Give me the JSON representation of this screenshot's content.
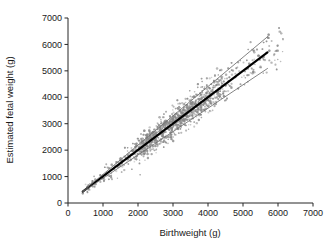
{
  "chart_data": {
    "type": "scatter",
    "title": "",
    "xlabel": "Birthweight (g)",
    "ylabel": "Estimated fetal weight (g)",
    "xlim": [
      0,
      7000
    ],
    "ylim": [
      0,
      7000
    ],
    "xticks": [
      0,
      1000,
      2000,
      3000,
      4000,
      5000,
      6000,
      7000
    ],
    "yticks": [
      0,
      1000,
      2000,
      3000,
      4000,
      5000,
      6000,
      7000
    ],
    "xticklabels": [
      "0",
      "1000",
      "2000",
      "3000",
      "4000",
      "5000",
      "6000",
      "7000"
    ],
    "yticklabels": [
      "0",
      "1000",
      "2000",
      "3000",
      "4000",
      "5000",
      "6000",
      "7000"
    ],
    "grid": false,
    "legend": "none",
    "point_color": "#8a8a8a",
    "point_size": 1.1,
    "n_points": 2100,
    "scatter_description": "Dense elongated cloud of small grey dots running diagonally from about (450,400) to (6100,5500), most densely packed between 2000 and 4000 g on both axes.",
    "scatter_domain": [
      420,
      6150
    ],
    "scatter_core_domain": [
      2000,
      4200
    ],
    "residual_sd_low": 120,
    "residual_sd_high": 430,
    "series": [
      {
        "name": "regression-line",
        "type": "line",
        "style": "thick-solid-black",
        "color": "#000000",
        "width": 2.1,
        "x": [
          420,
          5700
        ],
        "y": [
          430,
          5700
        ]
      },
      {
        "name": "upper-prediction-limit",
        "type": "line",
        "style": "thin-solid-grey",
        "color": "#6e6e6e",
        "width": 0.85,
        "x": [
          420,
          5700
        ],
        "y": [
          440,
          6290
        ]
      },
      {
        "name": "lower-prediction-limit",
        "type": "line",
        "style": "thin-solid-grey",
        "color": "#6e6e6e",
        "width": 0.85,
        "x": [
          420,
          5700
        ],
        "y": [
          420,
          5090
        ]
      }
    ],
    "colors": {
      "axis": "#262626",
      "text": "#1a1a1a",
      "points": "#8a8a8a",
      "fit_line": "#000000",
      "limit_lines": "#6e6e6e",
      "background": "#ffffff"
    }
  },
  "axes": {
    "x_axis_label": "Birthweight (g)",
    "y_axis_label": "Estimated fetal weight (g)"
  }
}
